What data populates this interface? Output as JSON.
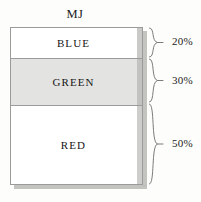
{
  "chart_data": {
    "type": "bar",
    "title": "MJ",
    "subtitle": "",
    "xlabel": "",
    "ylabel": "",
    "orientation": "vertical-stacked",
    "grid": false,
    "legend": "none",
    "ylim": [
      0,
      100
    ],
    "categories": [
      "MJ"
    ],
    "segments": [
      {
        "label": "BLUE",
        "value": 20,
        "value_label": "20%",
        "color": "#ffffff"
      },
      {
        "label": "GREEN",
        "value": 30,
        "value_label": "30%",
        "color": "#e3e3e1"
      },
      {
        "label": "RED",
        "value": 50,
        "value_label": "50%",
        "color": "#ffffff"
      }
    ],
    "annotations": [
      "20%",
      "30%",
      "50%"
    ],
    "units": "percent"
  },
  "colors": {
    "background": "#fdfdfb",
    "outline": "#9b9b9b",
    "shadow": "#b9b9b4",
    "text": "#1a1a1a",
    "green_fill": "#e3e3e1"
  }
}
